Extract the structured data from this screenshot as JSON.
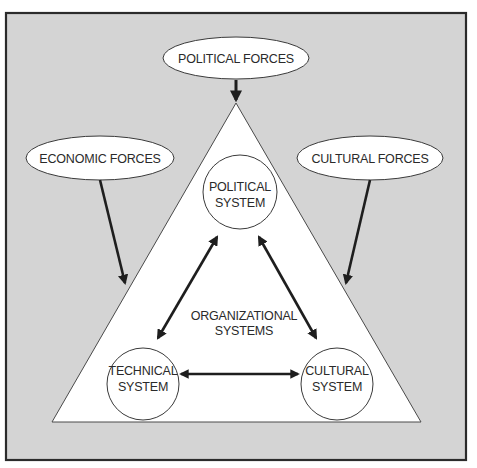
{
  "diagram": {
    "colors": {
      "background": "#d4d4d4",
      "frame": "#2b2b2b",
      "shape_fill": "#ffffff",
      "stroke": "#3a3a3a",
      "arrow": "#222222",
      "text": "#2a2a2a"
    },
    "external_forces": {
      "political": {
        "label": "POLITICAL FORCES"
      },
      "economic": {
        "label": "ECONOMIC FORCES"
      },
      "cultural": {
        "label": "CULTURAL FORCES"
      }
    },
    "center_label": {
      "line1": "ORGANIZATIONAL",
      "line2": "SYSTEMS"
    },
    "systems": {
      "political": {
        "line1": "POLITICAL",
        "line2": "SYSTEM"
      },
      "technical": {
        "line1": "TECHNICAL",
        "line2": "SYSTEM"
      },
      "cultural": {
        "line1": "CULTURAL",
        "line2": "SYSTEM"
      }
    },
    "relationships": [
      {
        "from": "POLITICAL FORCES",
        "to": "ORGANIZATIONAL SYSTEMS",
        "type": "one-way"
      },
      {
        "from": "ECONOMIC FORCES",
        "to": "ORGANIZATIONAL SYSTEMS",
        "type": "one-way"
      },
      {
        "from": "CULTURAL FORCES",
        "to": "ORGANIZATIONAL SYSTEMS",
        "type": "one-way"
      },
      {
        "from": "POLITICAL SYSTEM",
        "to": "TECHNICAL SYSTEM",
        "type": "two-way"
      },
      {
        "from": "POLITICAL SYSTEM",
        "to": "CULTURAL SYSTEM",
        "type": "two-way"
      },
      {
        "from": "TECHNICAL SYSTEM",
        "to": "CULTURAL SYSTEM",
        "type": "two-way"
      }
    ]
  }
}
